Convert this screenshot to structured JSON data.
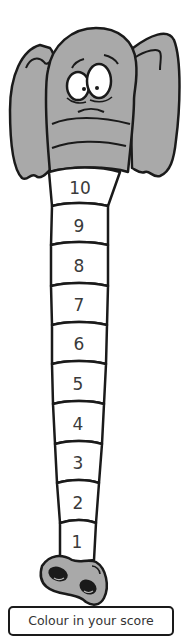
{
  "caption": "Colour in your score",
  "colors": {
    "elephant_fill": "#a9a9a9",
    "outline": "#1a1a1a",
    "segment_fill": "#ffffff",
    "text": "#3a3a3a"
  },
  "segments": [
    {
      "label": "10"
    },
    {
      "label": "9"
    },
    {
      "label": "8"
    },
    {
      "label": "7"
    },
    {
      "label": "6"
    },
    {
      "label": "5"
    },
    {
      "label": "4"
    },
    {
      "label": "3"
    },
    {
      "label": "2"
    },
    {
      "label": "1"
    }
  ]
}
